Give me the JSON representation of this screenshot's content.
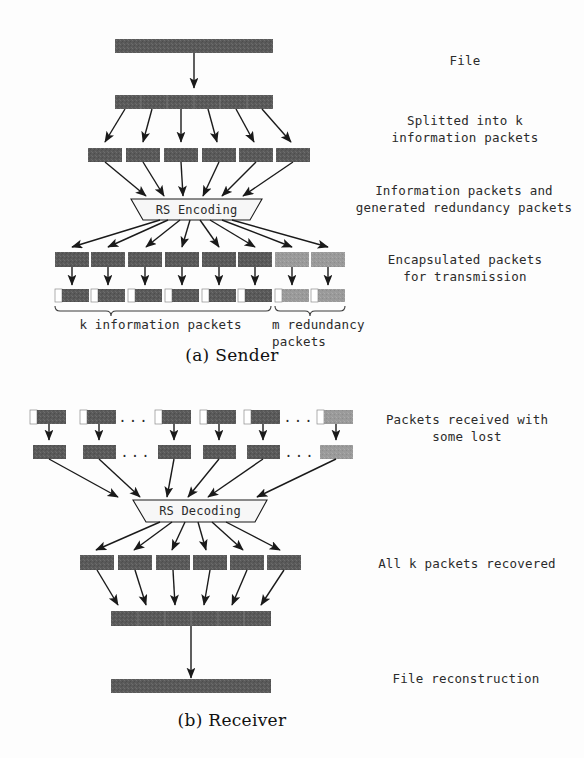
{
  "figure": {
    "title_fragment": "",
    "captions": {
      "sender": "(a) Sender",
      "receiver": "(b) Receiver"
    }
  },
  "sender": {
    "labels": {
      "file": "File",
      "split": "Splitted into k\ninformation packets",
      "encoded": "Information packets and\ngenerated redundancy packets",
      "encapsulated": "Encapsulated packets\nfor transmission"
    },
    "process_box": "RS Encoding",
    "brace_labels": {
      "information": "k information packets",
      "redundancy": "m redundancy packets"
    },
    "counts": {
      "information_packets": 6,
      "redundancy_packets": 2,
      "split_chunks": 6
    }
  },
  "receiver": {
    "labels": {
      "received": "Packets received with\nsome lost",
      "recovered": "All k packets recovered",
      "reconstruction": "File reconstruction"
    },
    "process_box": "RS Decoding",
    "ellipsis": "...",
    "counts": {
      "received_packets": 6,
      "recovered_packets": 6
    }
  },
  "colors": {
    "data_packet": "#5a5a5a",
    "redundancy_packet": "#9a9a9a",
    "header_segment": "#ffffff",
    "stroke": "#1a1a1a",
    "process_fill": "#f7f7f7",
    "text": "#2b2b2b"
  }
}
